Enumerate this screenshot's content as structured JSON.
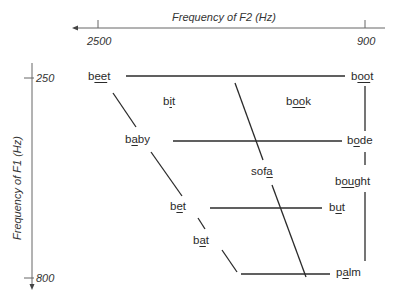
{
  "x_axis": {
    "title": "Frequency of F2 (Hz)",
    "ticks": [
      {
        "label": "2500"
      },
      {
        "label": "900"
      }
    ],
    "direction": "right-to-left"
  },
  "y_axis": {
    "title": "Frequency of F1 (Hz)",
    "ticks": [
      {
        "label": "250"
      },
      {
        "label": "800"
      }
    ],
    "direction": "top-to-bottom"
  },
  "vowels": {
    "beet": {
      "pre": "b",
      "u": "ee",
      "post": "t"
    },
    "boot": {
      "pre": "b",
      "u": "oo",
      "post": "t"
    },
    "bit": {
      "pre": "b",
      "u": "i",
      "post": "t"
    },
    "book": {
      "pre": "b",
      "u": "oo",
      "post": "k"
    },
    "baby": {
      "pre": "b",
      "u": "a",
      "post": "by"
    },
    "bode": {
      "pre": "b",
      "u": "o",
      "post": "de"
    },
    "sofa": {
      "pre": "sof",
      "u": "a",
      "post": ""
    },
    "bought": {
      "pre": "b",
      "u": "ou",
      "post": "ght"
    },
    "bet": {
      "pre": "b",
      "u": "e",
      "post": "t"
    },
    "but": {
      "pre": "b",
      "u": "u",
      "post": "t"
    },
    "bat": {
      "pre": "b",
      "u": "a",
      "post": "t"
    },
    "palm": {
      "pre": "p",
      "u": "a",
      "post": "lm"
    }
  },
  "colors": {
    "line": "#2b2b2b",
    "axis": "#555555",
    "text": "#2a2a2a"
  }
}
